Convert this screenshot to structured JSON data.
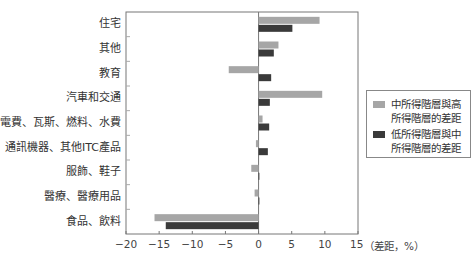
{
  "chart_data": {
    "type": "bar",
    "orientation": "horizontal",
    "title": "",
    "xlabel": "（差距，%）",
    "ylabel": "",
    "xlim": [
      -20,
      15
    ],
    "xticks": [
      -20,
      -15,
      -10,
      -5,
      0,
      5,
      10,
      15
    ],
    "xtick_labels": [
      "−20",
      "−15",
      "−10",
      "−5",
      "0",
      "5",
      "10",
      "15"
    ],
    "grid": false,
    "legend_position": "right",
    "categories": [
      "住宅",
      "其他",
      "教育",
      "汽車和交通",
      "電費、瓦斯、燃料、水費",
      "通訊機器、其他ITC產品",
      "服飾、鞋子",
      "醫療、醫療用品",
      "食品、飲料"
    ],
    "series": [
      {
        "name": "中所得階層與高所得階層的差距",
        "color": "#a6a6a6",
        "values": [
          9.2,
          3.0,
          -4.5,
          9.6,
          0.6,
          -0.4,
          -1.1,
          -0.6,
          -15.7
        ]
      },
      {
        "name": "低所得階層與中所得階層的差距",
        "color": "#3a3a3a",
        "values": [
          5.1,
          2.3,
          1.9,
          1.7,
          1.6,
          1.4,
          0.0,
          0.1,
          -14.0
        ]
      }
    ]
  },
  "legend": {
    "items": [
      {
        "label": "中所得階層與高所得階層的差距",
        "color": "#a6a6a6"
      },
      {
        "label": "低所得階層與中所得階層的差距",
        "color": "#3a3a3a"
      }
    ]
  },
  "axis": {
    "unit_label": "（差距，%）"
  }
}
